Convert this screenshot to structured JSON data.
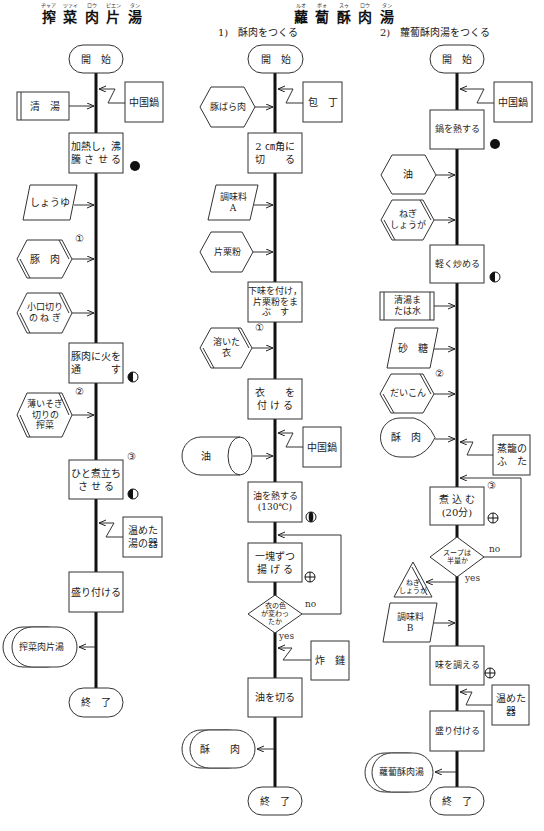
{
  "header": {
    "left_title": {
      "chars": [
        "搾",
        "菜",
        "肉",
        "片",
        "湯"
      ],
      "ruby": [
        "ヂャア",
        "ツァイ",
        "ロウ",
        "ピエン",
        "タン"
      ]
    },
    "right_title": {
      "chars": [
        "蘿",
        "蔔",
        "酥",
        "肉",
        "湯"
      ],
      "ruby": [
        "ルオ",
        "ボォ",
        "スゥ",
        "ロウ",
        "タン"
      ]
    },
    "subtitle_1": "1)　酥肉をつくる",
    "subtitle_2": "2)　蘿蔔酥肉湯をつくる"
  },
  "left": {
    "start": "開　始",
    "tool_pan": "中国鍋",
    "input_stock": "清　湯",
    "step_heat_boil": "加熱し，沸\n騰 さ せ る",
    "step_heat_boil_icon": "filled-circle",
    "input_soy": "しょうゆ",
    "input_pork": "豚　肉",
    "input_pork_order": "①",
    "input_negi": "小口切り\nの ね ぎ",
    "step_cook_pork": "豚肉に火を\n通　　　す",
    "step_cook_pork_icon": "half-circle",
    "input_zhacai": "薄いそぎ\n切りの\n搾菜",
    "input_zhacai_order": "②",
    "step_simmer": "ひと煮立ち\nさ せ る",
    "step_simmer_order": "③",
    "step_simmer_icon": "half-circle",
    "tool_bowl": "温めた\n湯の器",
    "step_serve": "盛り付ける",
    "output": "搾菜肉片湯",
    "end": "終　了"
  },
  "middle": {
    "start": "開　始",
    "tool_knife": "包　丁",
    "input_pork_belly": "豚ばら肉",
    "step_cut": "2 ㎝角に\n切　　る",
    "input_seasoning_a": "調味料\nA",
    "input_starch": "片栗粉",
    "step_marinate": "下味を付け，\n片栗粉をま\nぶ　す",
    "input_batter": "溶いた\n衣",
    "input_batter_order": "①",
    "step_coat": "衣　　を\n付 け る",
    "tool_pan": "中国鍋",
    "input_oil": "油",
    "step_heat_oil": "油を熱する\n(130℃)",
    "step_heat_oil_icon": "bar-circle",
    "step_fry": "一塊ずつ\n揚 げ る",
    "step_fry_icon": "cross-circle",
    "decision": "衣の色\nが変わっ\nたか",
    "decision_no": "no",
    "decision_yes": "yes",
    "tool_strainer": "炸　鏈",
    "step_drain": "油を切る",
    "output": "酥　　肉",
    "end": "終　了"
  },
  "right": {
    "start": "開　始",
    "tool_pan": "中国鍋",
    "step_heat_pan": "鍋を熱する",
    "step_heat_pan_icon": "filled-circle",
    "input_oil": "油",
    "input_negi_ginger": "ねぎ\nしょうが",
    "step_stir_fry": "軽く炒める",
    "step_stir_fry_icon": "half-circle",
    "input_stock_water": "清湯ま\nたは水",
    "input_sugar": "砂　糖",
    "input_daikon": "だいこん",
    "input_daikon_order": "②",
    "input_suro": "酥　肉",
    "tool_steamer_lid": "蒸籠の\nふ　た",
    "step_simmer": "煮 込 む\n(20分)",
    "step_simmer_order": "③",
    "step_simmer_icon": "cross-circle",
    "decision": "スープは\n半量か",
    "decision_no": "no",
    "decision_yes": "yes",
    "output_negi_ginger": "ねぎ\nしょうが",
    "input_seasoning_b": "調味料\nB",
    "step_season": "味を調える",
    "step_season_icon": "cross-circle",
    "tool_bowl": "温めた\n器",
    "step_serve": "盛り付ける",
    "output": "蘿蔔酥肉湯",
    "end": "終　了"
  }
}
